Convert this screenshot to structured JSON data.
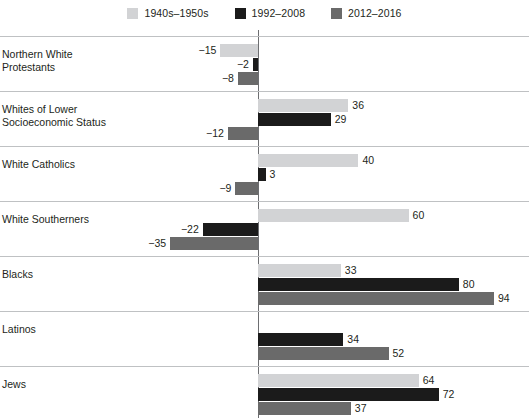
{
  "legend": {
    "entries": [
      {
        "label": "1940s–1950s",
        "color": "#d2d3d5",
        "key": "s1940_1950"
      },
      {
        "label": "1992–2008",
        "color": "#1b1b1b",
        "key": "s1992_2008"
      },
      {
        "label": "2012–2016",
        "color": "#6a6a6a",
        "key": "s2012_2016"
      }
    ]
  },
  "chart_data": {
    "type": "bar",
    "orientation": "horizontal",
    "title": "",
    "subtitle": "",
    "xlabel": "",
    "ylabel": "",
    "grid": false,
    "legend_position": "top-center",
    "zero_line": true,
    "xlim": [
      -40,
      100
    ],
    "categories": [
      "Northern White Protestants",
      "Whites of Lower Socioeconomic Status",
      "White Catholics",
      "White Southerners",
      "Blacks",
      "Latinos",
      "Jews"
    ],
    "category_lines": [
      [
        "Northern White",
        "Protestants"
      ],
      [
        "Whites of Lower",
        "Socioeconomic Status"
      ],
      [
        "White Catholics"
      ],
      [
        "White Southerners"
      ],
      [
        "Blacks"
      ],
      [
        "Latinos"
      ],
      [
        "Jews"
      ]
    ],
    "series": [
      {
        "name": "1940s–1950s",
        "color": "#d2d3d5",
        "values": [
          -15,
          36,
          40,
          60,
          33,
          null,
          64
        ]
      },
      {
        "name": "1992–2008",
        "color": "#1b1b1b",
        "values": [
          -2,
          29,
          3,
          -22,
          80,
          34,
          72
        ]
      },
      {
        "name": "2012–2016",
        "color": "#6a6a6a",
        "values": [
          -8,
          -12,
          -9,
          -35,
          94,
          52,
          37
        ]
      }
    ],
    "value_labels": {
      "Northern White Protestants": [
        "−15",
        "−2",
        "−8"
      ],
      "Whites of Lower Socioeconomic Status": [
        "36",
        "29",
        "−12"
      ],
      "White Catholics": [
        "40",
        "3",
        "−9"
      ],
      "White Southerners": [
        "60",
        "−22",
        "−35"
      ],
      "Blacks": [
        "33",
        "80",
        "94"
      ],
      "Latinos": [
        "",
        "34",
        "52"
      ],
      "Jews": [
        "64",
        "72",
        "37"
      ]
    }
  }
}
